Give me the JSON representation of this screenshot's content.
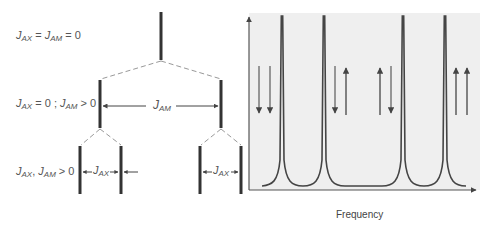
{
  "left_panel": {
    "rows": [
      {
        "id": "row1",
        "label_parts": [
          [
            "J",
            "AX"
          ],
          [
            " = "
          ],
          [
            "J",
            "AM"
          ],
          [
            " = 0"
          ]
        ]
      },
      {
        "id": "row2",
        "label_parts": [
          [
            "J",
            "AX"
          ],
          [
            " = 0 ; "
          ],
          [
            "J",
            "AM"
          ],
          [
            " > 0"
          ]
        ]
      },
      {
        "id": "row3",
        "label_parts": [
          [
            "J",
            "AX"
          ],
          [
            ", "
          ],
          [
            "J",
            "AM"
          ],
          [
            " > 0"
          ]
        ]
      }
    ],
    "coupling_labels": {
      "jam": [
        "J",
        "AM"
      ],
      "jax_left": [
        "J",
        "AX"
      ],
      "jax_right": [
        "J",
        "AX"
      ]
    }
  },
  "right_panel": {
    "xlabel": "Frequency",
    "background_color": "#efefef",
    "line_color": "#444444",
    "arrow_color": "#555555",
    "peaks": [
      {
        "x": 282,
        "spins": [
          "down",
          "down"
        ]
      },
      {
        "x": 324,
        "spins": [
          "down",
          "up"
        ]
      },
      {
        "x": 403,
        "spins": [
          "up",
          "down"
        ]
      },
      {
        "x": 445,
        "spins": [
          "up",
          "up"
        ]
      }
    ]
  }
}
